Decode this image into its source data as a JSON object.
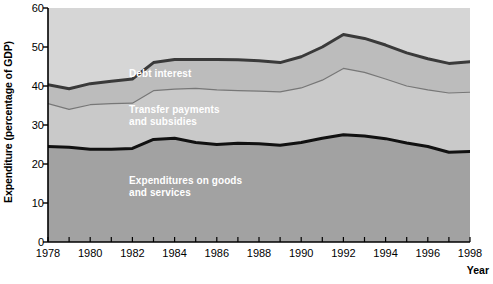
{
  "chart_data": {
    "type": "area",
    "stacked": true,
    "title": "",
    "xlabel": "Year",
    "ylabel": "Expenditure (percentage of GDP)",
    "xlim": [
      1978,
      1998
    ],
    "ylim": [
      0,
      60
    ],
    "y_ticks": [
      0,
      10,
      20,
      30,
      40,
      50,
      60
    ],
    "x_ticks": [
      1978,
      1979,
      1980,
      1981,
      1982,
      1983,
      1984,
      1985,
      1986,
      1987,
      1988,
      1989,
      1990,
      1991,
      1992,
      1993,
      1994,
      1995,
      1996,
      1997,
      1998
    ],
    "x_tick_labels": [
      "1978",
      "",
      "1980",
      "",
      "1982",
      "",
      "1984",
      "",
      "1986",
      "",
      "1988",
      "",
      "1990",
      "",
      "1992",
      "",
      "1994",
      "",
      "1996",
      "",
      "1998"
    ],
    "grid": false,
    "legend_position": "in-plot",
    "x": [
      1978,
      1979,
      1980,
      1981,
      1982,
      1983,
      1984,
      1985,
      1986,
      1987,
      1988,
      1989,
      1990,
      1991,
      1992,
      1993,
      1994,
      1995,
      1996,
      1997,
      1998
    ],
    "series": [
      {
        "name": "Expenditures on goods and services",
        "cumulative_top": [
          24.5,
          24.3,
          23.8,
          23.8,
          24.0,
          26.3,
          26.6,
          25.5,
          25.0,
          25.3,
          25.2,
          24.8,
          25.5,
          26.6,
          27.5,
          27.2,
          26.5,
          25.4,
          24.5,
          23.0,
          23.2
        ],
        "color": "#a2a2a2",
        "line_color": "#111111",
        "line_width": 3
      },
      {
        "name": "Transfer payments and subsidies",
        "cumulative_top": [
          35.5,
          34.0,
          35.2,
          35.5,
          35.6,
          38.8,
          39.2,
          39.4,
          39.0,
          38.8,
          38.7,
          38.5,
          39.5,
          41.5,
          44.5,
          43.5,
          41.8,
          40.0,
          39.0,
          38.2,
          38.4
        ],
        "color": "#c9c9c9",
        "line_color": "#777777",
        "line_width": 1.2
      },
      {
        "name": "Debt interest",
        "cumulative_top": [
          40.3,
          39.3,
          40.6,
          41.2,
          41.8,
          46.0,
          46.8,
          46.8,
          46.8,
          46.7,
          46.5,
          46.0,
          47.5,
          50.0,
          53.2,
          52.2,
          50.5,
          48.5,
          47.0,
          45.8,
          46.2
        ],
        "color": "#bcbcbc",
        "line_color": "#3a3a3a",
        "line_width": 3
      }
    ],
    "background_color": "#d6d6d6",
    "page_background": "#ffffff"
  },
  "labels": {
    "y_axis_title": "Expenditure (percentage of GDP)",
    "x_axis_title": "Year",
    "debt_interest": "Debt interest",
    "transfer_payments": "Transfer payments\nand subsidies",
    "goods_services": "Expenditures on goods\nand services"
  },
  "y_tick_text": [
    "60",
    "50",
    "40",
    "30",
    "20",
    "10",
    "0"
  ],
  "x_tick_text": [
    "1978",
    "1980",
    "1982",
    "1984",
    "1986",
    "1988",
    "1990",
    "1992",
    "1994",
    "1996",
    "1998"
  ]
}
